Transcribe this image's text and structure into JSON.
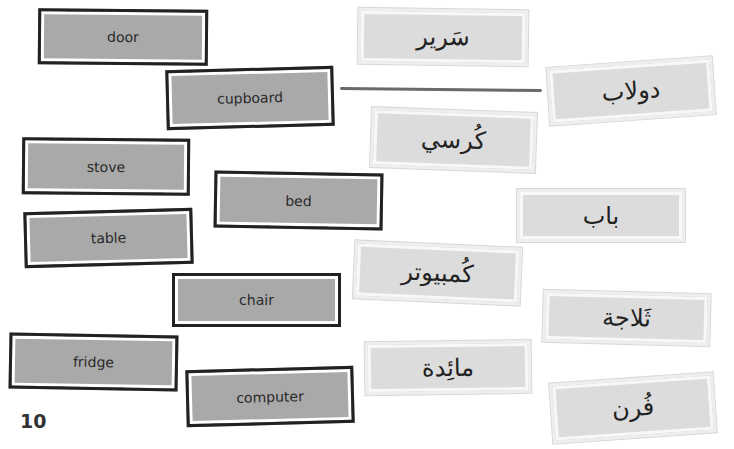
{
  "page_number": "10",
  "english_words": [
    {
      "id": "door",
      "label": "door"
    },
    {
      "id": "cupboard",
      "label": "cupboard"
    },
    {
      "id": "stove",
      "label": "stove"
    },
    {
      "id": "bed",
      "label": "bed"
    },
    {
      "id": "table",
      "label": "table"
    },
    {
      "id": "chair",
      "label": "chair"
    },
    {
      "id": "fridge",
      "label": "fridge"
    },
    {
      "id": "computer",
      "label": "computer"
    }
  ],
  "arabic_words": [
    {
      "id": "bed",
      "label": "سَرير"
    },
    {
      "id": "cupboard",
      "label": "دولاب"
    },
    {
      "id": "chair",
      "label": "كُرسي"
    },
    {
      "id": "door",
      "label": "باب"
    },
    {
      "id": "computer",
      "label": "كُمبيوتر"
    },
    {
      "id": "fridge",
      "label": "ثَلاجة"
    },
    {
      "id": "table",
      "label": "مائِدة"
    },
    {
      "id": "stove",
      "label": "فُرن"
    }
  ],
  "matches": [
    {
      "from": "cupboard",
      "to": "دولاب"
    }
  ],
  "colors": {
    "english_card_fill": "#a9a9a9",
    "english_card_border": "#222222",
    "arabic_card_fill": "#dcdcdc",
    "arabic_card_border": "#eeeeee",
    "match_line": "#6a6a6a"
  }
}
